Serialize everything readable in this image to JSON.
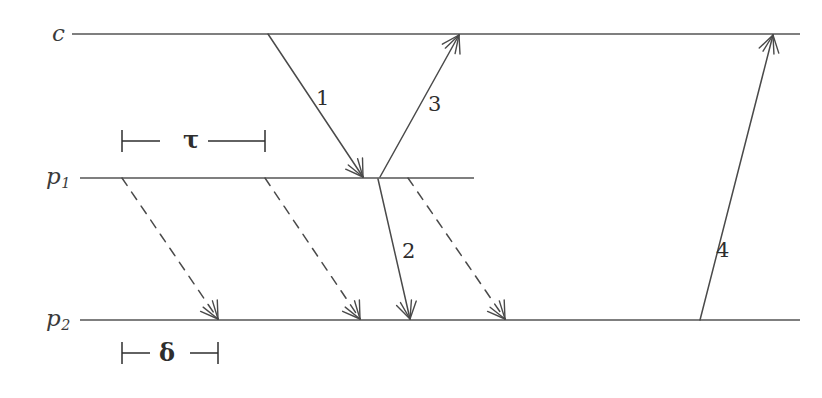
{
  "figure": {
    "type": "timing-diagram",
    "background_color": "#ffffff",
    "line_color": "#555555",
    "ray_color": "#4a4a4a",
    "text_color": "#2e2e2e",
    "width": 822,
    "height": 398
  },
  "axes": [
    {
      "name": "clock-axis",
      "label_main": "c",
      "label_sub": "",
      "label_x": 52,
      "label_y": 22,
      "label_size": 23,
      "line_x1": 72,
      "line_x2": 800,
      "line_y": 34
    },
    {
      "name": "process-1-axis",
      "label_main": "p",
      "label_sub": "1",
      "label_x": 46,
      "label_y": 165,
      "label_size": 23,
      "line_x1": 80,
      "line_x2": 474,
      "line_y": 178
    },
    {
      "name": "process-2-axis",
      "label_main": "p",
      "label_sub": "2",
      "label_x": 46,
      "label_y": 307,
      "label_size": 23,
      "line_x1": 80,
      "line_x2": 800,
      "line_y": 320
    }
  ],
  "rays": [
    {
      "id": "ray-1",
      "label": "1",
      "label_x": 316,
      "label_y": 88,
      "label_size": 21,
      "x1": 268,
      "y1": 34,
      "x2": 363,
      "y2": 177,
      "dashed": false,
      "arrow": true
    },
    {
      "id": "ray-2",
      "label": "2",
      "label_x": 402,
      "label_y": 241,
      "label_size": 21,
      "x1": 378,
      "y1": 179,
      "x2": 410,
      "y2": 319,
      "dashed": false,
      "arrow": true
    },
    {
      "id": "ray-3",
      "label": "3",
      "label_x": 428,
      "label_y": 94,
      "label_size": 21,
      "x1": 380,
      "y1": 177,
      "x2": 459,
      "y2": 35,
      "dashed": false,
      "arrow": true
    },
    {
      "id": "ray-4",
      "label": "4",
      "label_x": 716,
      "label_y": 240,
      "label_size": 21,
      "x1": 700,
      "y1": 320,
      "x2": 773,
      "y2": 35,
      "dashed": false,
      "arrow": true
    }
  ],
  "dashed_rays": [
    {
      "id": "dashed-ray-a",
      "x1": 122,
      "y1": 178,
      "x2": 218,
      "y2": 319,
      "dashed": true,
      "arrow": true
    },
    {
      "id": "dashed-ray-b",
      "x1": 265,
      "y1": 178,
      "x2": 360,
      "y2": 319,
      "dashed": true,
      "arrow": true
    },
    {
      "id": "dashed-ray-c",
      "x1": 408,
      "y1": 178,
      "x2": 505,
      "y2": 319,
      "dashed": true,
      "arrow": true
    }
  ],
  "measures": [
    {
      "id": "tau-measure",
      "symbol": "τ",
      "symbol_x": 183,
      "symbol_y": 128,
      "symbol_size": 24,
      "x1": 122,
      "x2": 265,
      "y": 141,
      "tick_half_height": 11,
      "gap_left": 160,
      "gap_right": 208
    },
    {
      "id": "delta-measure",
      "symbol": "δ",
      "symbol_x": 159,
      "symbol_y": 341,
      "symbol_size": 24,
      "x1": 122,
      "x2": 218,
      "y": 353,
      "tick_half_height": 11,
      "gap_left": 150,
      "gap_right": 190
    }
  ]
}
